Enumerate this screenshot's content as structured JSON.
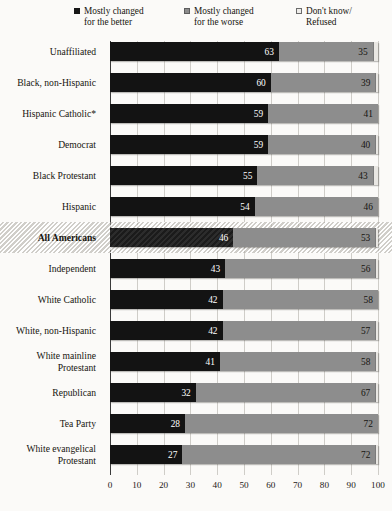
{
  "chart_data": {
    "type": "bar",
    "orientation": "horizontal",
    "stacked": true,
    "title": "",
    "subtitle": "",
    "xlabel": "",
    "ylabel": "",
    "xlim": [
      0,
      100
    ],
    "xticks": [
      "0",
      "10",
      "20",
      "30",
      "40",
      "50",
      "60",
      "70",
      "80",
      "90",
      "100"
    ],
    "grid": true,
    "legend_position": "top",
    "highlight_category": "All Americans",
    "categories": [
      "Unaffiliated",
      "Black, non-Hispanic",
      "Hispanic Catholic*",
      "Democrat",
      "Black Protestant",
      "Hispanic",
      "All Americans",
      "Independent",
      "White Catholic",
      "White, non-Hispanic",
      "White mainline Protestant",
      "Republican",
      "Tea Party",
      "White evangelical Protestant"
    ],
    "series": [
      {
        "name": "Mostly changed for the better",
        "color": "#131313",
        "values": [
          63,
          60,
          59,
          59,
          55,
          54,
          46,
          43,
          42,
          42,
          41,
          32,
          28,
          27
        ]
      },
      {
        "name": "Mostly changed for the worse",
        "color": "#8d8d8d",
        "values": [
          35,
          39,
          41,
          40,
          43,
          46,
          53,
          56,
          58,
          57,
          58,
          67,
          72,
          72
        ]
      },
      {
        "name": "Don't know/ Refused",
        "color": "#e9e7e3",
        "values": [
          2,
          1,
          0,
          1,
          2,
          0,
          1,
          1,
          0,
          1,
          1,
          1,
          0,
          1
        ]
      }
    ]
  },
  "legend": {
    "items": [
      {
        "label_line1": "Mostly changed",
        "label_line2": "for the better",
        "swatch": "black-square-icon"
      },
      {
        "label_line1": "Mostly changed",
        "label_line2": "for the worse",
        "swatch": "gray-square-icon"
      },
      {
        "label_line1": "Don't know/",
        "label_line2": "Refused",
        "swatch": "light-square-icon"
      }
    ]
  }
}
